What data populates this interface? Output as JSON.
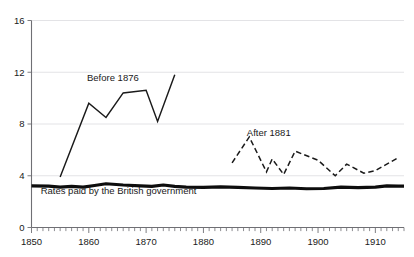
{
  "chart_data": {
    "type": "line",
    "title": "",
    "xlabel": "",
    "ylabel": "",
    "xlim": [
      1850,
      1915
    ],
    "ylim": [
      0,
      16
    ],
    "grid": true,
    "legend_position": "inline-annotations",
    "y_ticks": [
      0,
      4,
      8,
      12,
      16
    ],
    "y_ticklabels": [
      "0",
      "4",
      "8",
      "12",
      "16"
    ],
    "x_ticks": [
      1850,
      1860,
      1870,
      1880,
      1890,
      1900,
      1910
    ],
    "x_ticklabels": [
      "1850",
      "1860",
      "1870",
      "1880",
      "1890",
      "1900",
      "1910"
    ],
    "x_minor_tick_interval": 1,
    "series": [
      {
        "name": "Before 1876",
        "style": "solid",
        "label_position": {
          "x": 1864.2,
          "y": 11.35
        },
        "x": [
          1855,
          1860,
          1863,
          1866,
          1870,
          1872,
          1875
        ],
        "values": [
          3.9,
          9.6,
          8.5,
          10.4,
          10.6,
          8.2,
          11.8
        ]
      },
      {
        "name": "After 1881",
        "style": "dashed",
        "label_position": {
          "x": 1891.4,
          "y": 7.05
        },
        "x": [
          1885,
          1888,
          1891,
          1892,
          1894,
          1896,
          1900,
          1903,
          1905,
          1908,
          1910,
          1914
        ],
        "values": [
          5.0,
          7.0,
          4.3,
          5.3,
          4.1,
          5.9,
          5.2,
          4.0,
          4.9,
          4.2,
          4.4,
          5.4
        ]
      },
      {
        "name": "Rates paid by the British government",
        "style": "thick-solid",
        "label_position": {
          "x": 1851.6,
          "y": 2.62
        },
        "x": [
          1850,
          1853,
          1855,
          1857,
          1859,
          1861,
          1863,
          1866,
          1869,
          1871,
          1873,
          1875,
          1877,
          1880,
          1883,
          1886,
          1889,
          1892,
          1895,
          1898,
          1901,
          1904,
          1907,
          1910,
          1912,
          1914,
          1915
        ],
        "values": [
          3.22,
          3.2,
          3.12,
          3.18,
          3.12,
          3.25,
          3.38,
          3.28,
          3.22,
          3.18,
          3.28,
          3.18,
          3.12,
          3.1,
          3.14,
          3.1,
          3.05,
          3.02,
          3.05,
          3.0,
          3.02,
          3.12,
          3.08,
          3.12,
          3.22,
          3.2,
          3.2
        ]
      }
    ],
    "colors": {
      "line": "#1a1a1a",
      "axis": "#6f6f74",
      "grid": "#e3e3e6",
      "background": "#ffffff"
    }
  }
}
